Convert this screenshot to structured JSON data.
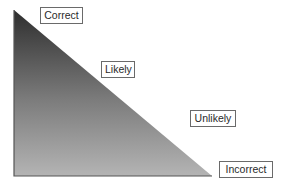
{
  "diagram": {
    "type": "gradient-right-triangle-scale",
    "labels": [
      {
        "id": "correct",
        "text": "Correct"
      },
      {
        "id": "likely",
        "text": "Likely"
      },
      {
        "id": "unlikely",
        "text": "Unlikely"
      },
      {
        "id": "incorrect",
        "text": "Incorrect"
      }
    ],
    "colors": {
      "gradient_top": "#2e2e2e",
      "gradient_bottom": "#b4b4b4",
      "edge": "#555555",
      "label_border": "#6a6a6a",
      "label_text": "#2a2a2a",
      "background": "#ffffff"
    }
  }
}
